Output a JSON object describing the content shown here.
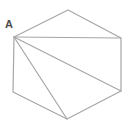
{
  "figure": {
    "type": "geometry-diagram",
    "background": "#ffffff",
    "line_color": "#a6a6a6",
    "line_width": 1.2,
    "label": {
      "text": "A",
      "x": 9,
      "y": 28,
      "font_size": 11,
      "color": "#4d4d4d"
    },
    "hexagon_vertices": [
      {
        "name": "A",
        "x": 14,
        "y": 37
      },
      {
        "name": "top",
        "x": 68,
        "y": 10
      },
      {
        "name": "right-top",
        "x": 121,
        "y": 38
      },
      {
        "name": "right-bottom",
        "x": 121,
        "y": 91
      },
      {
        "name": "bottom",
        "x": 67,
        "y": 119
      },
      {
        "name": "left-bottom",
        "x": 13,
        "y": 92
      }
    ],
    "diagonals": [
      {
        "from": "A",
        "to": "right-top"
      },
      {
        "from": "A",
        "to": "right-bottom"
      },
      {
        "from": "A",
        "to": "bottom"
      }
    ]
  }
}
